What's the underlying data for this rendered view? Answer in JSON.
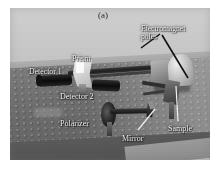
{
  "figure": {
    "panel_label": "(a)",
    "caption_kind": "photograph"
  },
  "photo": {
    "alt": "Grayscale photograph of an optical bench experiment on a holed breadboard table",
    "colors": {
      "background_upper": "#c6c6c6",
      "table_surface": "#6f6f6f",
      "front_band": "#545454",
      "component_dark": "#101010",
      "component_light": "#dcdcdc",
      "label_text": "#f2f2f2",
      "panel_label_text": "#2b2b2b"
    }
  },
  "annotations": [
    {
      "id": "panel",
      "text": "(a)"
    },
    {
      "id": "electromagnet",
      "text": "Electromagnet\npoles"
    },
    {
      "id": "detector1",
      "text": "Detector 1"
    },
    {
      "id": "prism",
      "text": "Prism"
    },
    {
      "id": "detector2",
      "text": "Detector 2"
    },
    {
      "id": "polarizer",
      "text": "Polarizer"
    },
    {
      "id": "mirror",
      "text": "Mirror"
    },
    {
      "id": "sample",
      "text": "Sample"
    }
  ],
  "components": [
    {
      "name": "electromagnet-poles",
      "label": "Electromagnet poles"
    },
    {
      "name": "detector-1",
      "label": "Detector 1"
    },
    {
      "name": "prism",
      "label": "Prism"
    },
    {
      "name": "detector-2",
      "label": "Detector 2"
    },
    {
      "name": "polarizer",
      "label": "Polarizer"
    },
    {
      "name": "mirror",
      "label": "Mirror"
    },
    {
      "name": "sample",
      "label": "Sample"
    }
  ]
}
